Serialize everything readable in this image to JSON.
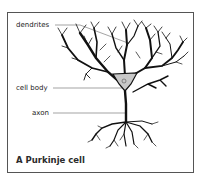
{
  "figure": {
    "title": "A Purkinje cell",
    "labels": [
      {
        "text": "dendrites"
      },
      {
        "text": "cell body"
      },
      {
        "text": "axon"
      }
    ],
    "colors": {
      "neuron": "#111111",
      "cell_body_fill": "#c8c8c8",
      "leader_line": "#666666",
      "frame": "#555555"
    }
  }
}
